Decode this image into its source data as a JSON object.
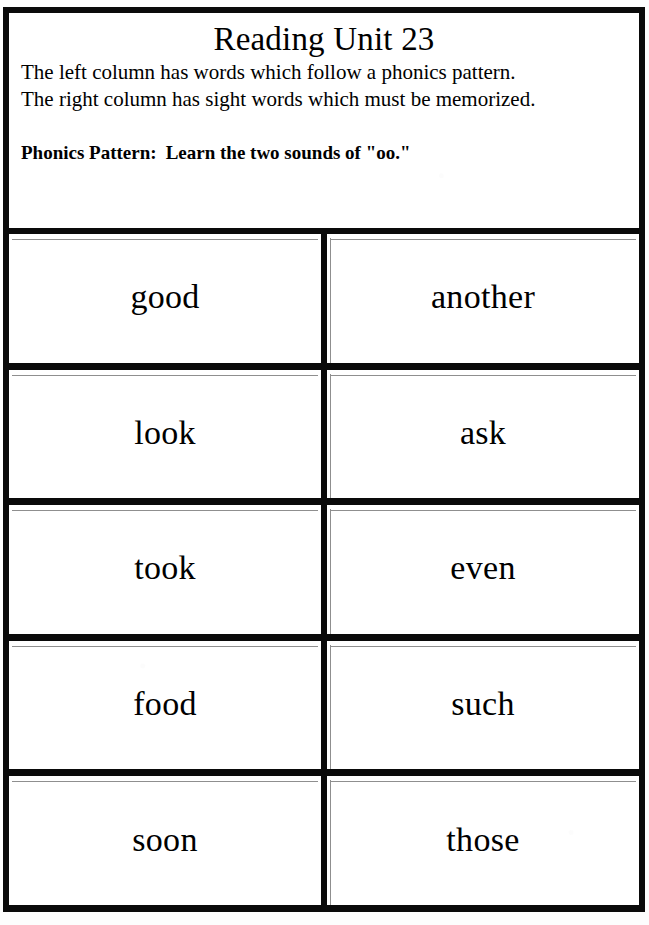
{
  "worksheet": {
    "title": "Reading Unit 23",
    "description_lines": [
      "The left column has words which follow a phonics pattern.",
      "The right column has sight words which must be memorized."
    ],
    "pattern_label": "Phonics Pattern:",
    "pattern_value": "Learn the two sounds of \"oo.\"",
    "columns": {
      "left_description": "phonics pattern words",
      "right_description": "sight words"
    },
    "rows": [
      {
        "left": "good",
        "right": "another"
      },
      {
        "left": "look",
        "right": "ask"
      },
      {
        "left": "took",
        "right": "even"
      },
      {
        "left": "food",
        "right": "such"
      },
      {
        "left": "soon",
        "right": "those"
      }
    ]
  },
  "colors": {
    "ink": "#0a0a0a",
    "paper": "#fdfdfd",
    "inner_rule": "#8f8f8f"
  }
}
